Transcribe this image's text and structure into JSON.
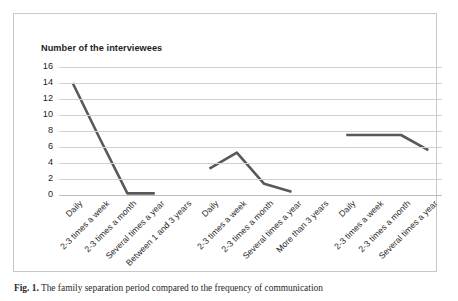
{
  "figure": {
    "caption_label": "Fig. 1.",
    "caption_text": "The family separation period compared to the frequency of communication"
  },
  "chart_data": {
    "type": "line",
    "title": "Number of the interviewees",
    "xlabel": "",
    "ylabel": "Number of the interviewees",
    "ylim": [
      0,
      16
    ],
    "yticks": [
      0,
      2,
      4,
      6,
      8,
      10,
      12,
      14,
      16
    ],
    "grid": true,
    "legend": "none",
    "categories": [
      "Daily",
      "2-3 times a week",
      "2-3 times a month",
      "Several times a year",
      "Between 1 and 3 years",
      "Daily",
      "2-3 times a week",
      "2-3 times a month",
      "Several times a year",
      "More than 3 years",
      "Daily",
      "2-3 times a week",
      "2-3 times a month",
      "Several times a year"
    ],
    "values": [
      14,
      7,
      0.2,
      0.2,
      null,
      3.3,
      5.3,
      1.4,
      0.4,
      null,
      7.5,
      7.5,
      7.5,
      5.6
    ],
    "groups": [
      {
        "name": "Less than 1 year",
        "categories": [
          "Daily",
          "2-3 times a week",
          "2-3 times a month",
          "Several times a year"
        ],
        "values": [
          14,
          7,
          0.2,
          0.2
        ]
      },
      {
        "name": "Between 1 and 3 years",
        "categories": [
          "Daily",
          "2-3 times a week",
          "2-3 times a month",
          "Several times a year"
        ],
        "values": [
          3.3,
          5.3,
          1.4,
          0.4
        ]
      },
      {
        "name": "More than 3 years",
        "categories": [
          "Daily",
          "2-3 times a week",
          "2-3 times a month",
          "Several times a year"
        ],
        "values": [
          7.5,
          7.5,
          7.5,
          5.6
        ]
      }
    ],
    "series_color": "#595959",
    "grid_color": "#d0d0d0"
  },
  "axis": {
    "tick_0": "0",
    "tick_2": "2",
    "tick_4": "4",
    "tick_6": "6",
    "tick_8": "8",
    "tick_10": "10",
    "tick_12": "12",
    "tick_14": "14",
    "tick_16": "16"
  },
  "xaxis": {
    "labels": [
      "Daily",
      "2-3 times a week",
      "2-3 times a month",
      "Several times a year",
      "Between 1 and 3 years",
      "Daily",
      "2-3 times a week",
      "2-3 times a month",
      "Several times a year",
      "More than 3 years",
      "Daily",
      "2-3 times a week",
      "2-3 times a month",
      "Several times a year"
    ]
  }
}
